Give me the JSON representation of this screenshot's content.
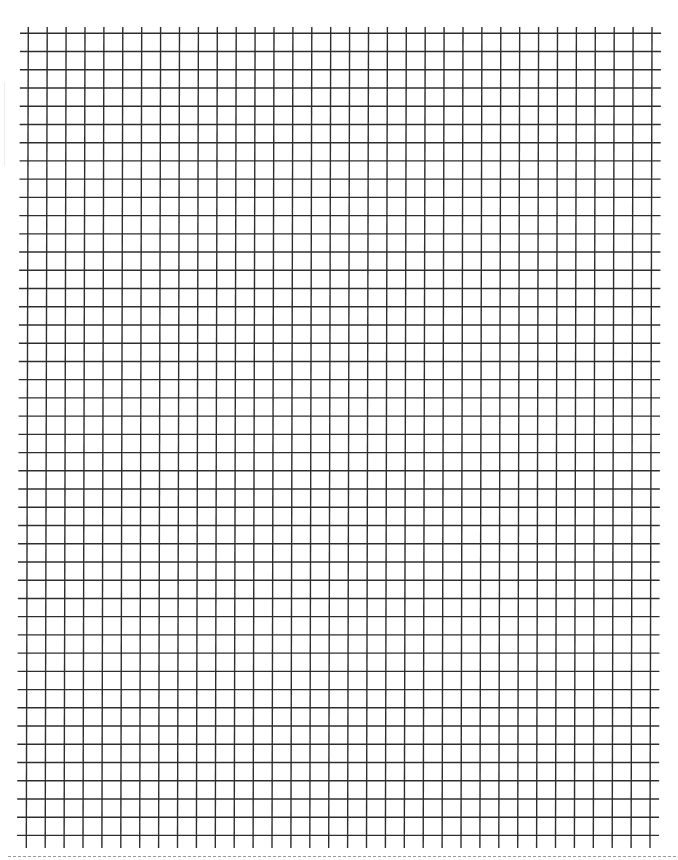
{
  "document": {
    "type": "graph-paper",
    "background_color": "#ffffff",
    "line_color": "#2e2e2e",
    "line_width": 1.4,
    "grid": {
      "vertical_lines": {
        "count": 34,
        "first_x_top": 28.3,
        "first_x_bottom": 26.3,
        "spacing": 18.9,
        "y_start": 27,
        "y_end": 848
      },
      "horizontal_lines": {
        "count": 45,
        "first_y": 33.3,
        "spacing": 18.23,
        "x_start_top": 20,
        "x_end_top": 661,
        "x_start_bottom": 17,
        "x_end_bottom": 659
      }
    },
    "cut_line": {
      "style": "dotted",
      "y": 857,
      "color": "#9a9a9a"
    }
  }
}
